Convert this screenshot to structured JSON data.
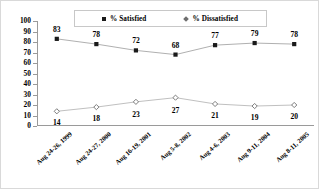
{
  "chart_data": {
    "type": "line",
    "title": "",
    "xlabel": "",
    "ylabel": "",
    "ylim": [
      0,
      100
    ],
    "yticks": [
      0,
      10,
      20,
      30,
      40,
      50,
      60,
      70,
      80,
      90,
      100
    ],
    "grid": false,
    "legend_position": "top-center",
    "categories": [
      "Aug 24-26, 1999",
      "Aug 24-27, 2000",
      "Aug 16-19, 2001",
      "Aug 5-8, 2002",
      "Aug 4-6, 2003",
      "Aug 9-11, 2004",
      "Aug 8-11, 2005"
    ],
    "series": [
      {
        "name": "% Satisfied",
        "marker": "square",
        "color": "#1a1a1a",
        "line_color": "#b0b0b0",
        "values": [
          83,
          78,
          72,
          68,
          77,
          79,
          78
        ],
        "label_position": "above"
      },
      {
        "name": "% Dissatisfied",
        "marker": "diamond",
        "color": "#6e6e6e",
        "line_color": "#c0c0c0",
        "values": [
          14,
          18,
          23,
          27,
          21,
          19,
          20
        ],
        "label_position": "mixed"
      }
    ]
  },
  "legend": {
    "entries": [
      {
        "label": "% Satisfied",
        "marker": "square-marker"
      },
      {
        "label": "% Dissatisfied",
        "marker": "diamond-marker"
      }
    ]
  },
  "axis": {
    "y_tick_labels": [
      "100",
      "90",
      "80",
      "70",
      "60",
      "50",
      "40",
      "30",
      "20",
      "10",
      "0"
    ],
    "x_tick_labels": [
      "Aug 24-26, 1999",
      "Aug 24-27, 2000",
      "Aug 16-19, 2001",
      "Aug 5-8, 2002",
      "Aug 4-6, 2003",
      "Aug 9-11, 2004",
      "Aug 8-11, 2005"
    ]
  },
  "data_labels": {
    "satisfied": [
      "83",
      "78",
      "72",
      "68",
      "77",
      "79",
      "78"
    ],
    "dissatisfied": [
      "14",
      "18",
      "23",
      "27",
      "21",
      "19",
      "20"
    ]
  }
}
